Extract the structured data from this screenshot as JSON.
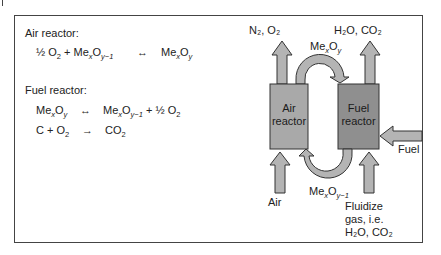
{
  "air_reactor_section": {
    "title": "Air reactor:",
    "equation": {
      "lhs_a": "½ O",
      "lhs_a_sub": "2",
      "lhs_plus": " + Me",
      "lhs_me_sub": "x",
      "lhs_o": "O",
      "lhs_o_sub": "y−1",
      "arrow": "↔",
      "rhs_me": "Me",
      "rhs_me_sub": "x",
      "rhs_o": "O",
      "rhs_o_sub": "y"
    }
  },
  "fuel_reactor_section": {
    "title": "Fuel reactor:",
    "equation1": {
      "lhs_me": "Me",
      "lhs_me_sub": "x",
      "lhs_o": "O",
      "lhs_o_sub": "y",
      "arrow": "↔",
      "rhs_me": "Me",
      "rhs_me_sub": "x",
      "rhs_o": "O",
      "rhs_o_sub": "y−1",
      "rhs_tail": " + ½ O",
      "rhs_tail_sub": "2"
    },
    "equation2": {
      "lhs": "C + O",
      "lhs_sub": "2",
      "arrow": "→",
      "rhs": "CO",
      "rhs_sub": "2"
    }
  },
  "diagram": {
    "air_reactor_label_1": "Air",
    "air_reactor_label_2": "reactor",
    "fuel_reactor_label_1": "Fuel",
    "fuel_reactor_label_2": "reactor",
    "air_outlet": "N₂, O₂",
    "fuel_outlet": "H₂O, CO₂",
    "oxidized_carrier": "MeₓO_y",
    "oxidized_carrier_me": "Me",
    "oxidized_carrier_me_sub": "x",
    "oxidized_carrier_o": "O",
    "oxidized_carrier_o_sub": "y",
    "reduced_carrier_me": "Me",
    "reduced_carrier_me_sub": "x",
    "reduced_carrier_o": "O",
    "reduced_carrier_o_sub": "y−1",
    "air_inlet": "Air",
    "fuel_inlet": "Fuel",
    "fluidize_1": "Fluidize",
    "fluidize_2": "gas, i.e.",
    "fluidize_3": "H₂O, CO₂",
    "colors": {
      "air_reactor": "#a9a9a9",
      "fuel_reactor": "#8f8f8f",
      "arrow_fill": "#b4b4b4",
      "stroke": "#333333",
      "frame": "#444444"
    }
  }
}
